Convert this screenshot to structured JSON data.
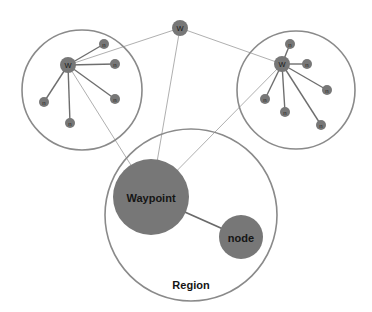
{
  "diagram": {
    "colors": {
      "node_fill": "#777777",
      "outline": "#8a8a8a",
      "thin_link": "#a6a6a6",
      "spoke": "#6e6e6e",
      "background": "#ffffff"
    },
    "top_waypoint": {
      "label": "W",
      "x": 180,
      "y": 28,
      "r": 8
    },
    "clusters": [
      {
        "id": "left",
        "region": {
          "x": 82,
          "y": 90,
          "r": 60
        },
        "waypoint": {
          "label": "W",
          "x": 68,
          "y": 65,
          "r": 8
        },
        "nodes": [
          {
            "label": "n",
            "x": 104,
            "y": 44,
            "r": 5
          },
          {
            "label": "n",
            "x": 115,
            "y": 64,
            "r": 5
          },
          {
            "label": "n",
            "x": 115,
            "y": 99,
            "r": 5
          },
          {
            "label": "n",
            "x": 70,
            "y": 123,
            "r": 5
          },
          {
            "label": "n",
            "x": 44,
            "y": 102,
            "r": 5
          }
        ]
      },
      {
        "id": "right",
        "region": {
          "x": 296,
          "y": 90,
          "r": 59
        },
        "waypoint": {
          "label": "W",
          "x": 282,
          "y": 64,
          "r": 8
        },
        "nodes": [
          {
            "label": "n",
            "x": 290,
            "y": 44,
            "r": 5
          },
          {
            "label": "n",
            "x": 307,
            "y": 64,
            "r": 5
          },
          {
            "label": "n",
            "x": 327,
            "y": 90,
            "r": 5
          },
          {
            "label": "n",
            "x": 321,
            "y": 125,
            "r": 5
          },
          {
            "label": "n",
            "x": 285,
            "y": 112,
            "r": 5
          },
          {
            "label": "n",
            "x": 265,
            "y": 99,
            "r": 5
          }
        ]
      }
    ],
    "main_region": {
      "label": "Region",
      "x": 191,
      "y": 215,
      "r": 86,
      "label_x": 191,
      "label_y": 285
    },
    "main_waypoint": {
      "label": "Waypoint",
      "x": 151,
      "y": 197,
      "r": 38
    },
    "main_node": {
      "label": "node",
      "x": 241,
      "y": 237,
      "r": 22
    }
  }
}
